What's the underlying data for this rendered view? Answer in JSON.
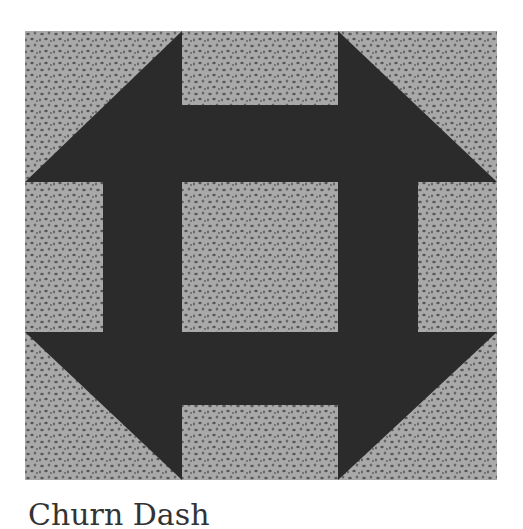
{
  "figure": {
    "title": "Churn Dash",
    "colors": {
      "dark_fabric": "#2b2b2b",
      "light_fabric": "#a9a9a9",
      "speckle": "#5a5a5a",
      "background": "#ffffff"
    },
    "grid": {
      "columns": [
        0,
        78,
        157,
        313,
        393,
        472
      ],
      "rows": [
        0,
        74,
        151,
        301,
        374,
        449
      ]
    }
  },
  "caption": {
    "text": "Churn Dash"
  }
}
